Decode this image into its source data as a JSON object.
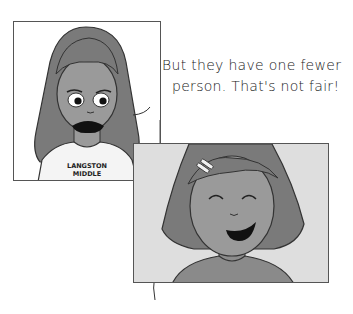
{
  "comic": {
    "panels": [
      {
        "id": "panel-1",
        "character": "girl with long hair, worried expression",
        "shirt_text": [
          "LANGSTON",
          "MIDDLE"
        ]
      },
      {
        "id": "panel-2",
        "character": "girl with short bob hair and hair clip, smiling"
      }
    ],
    "speech_bubble": {
      "lines": [
        "But they have one fewer",
        "person. That's not fair!"
      ]
    },
    "colors": {
      "hair": "#7a7a7a",
      "skin": "#9a9a9a",
      "panel2_bg": "#dedede",
      "outline": "#333333"
    }
  }
}
